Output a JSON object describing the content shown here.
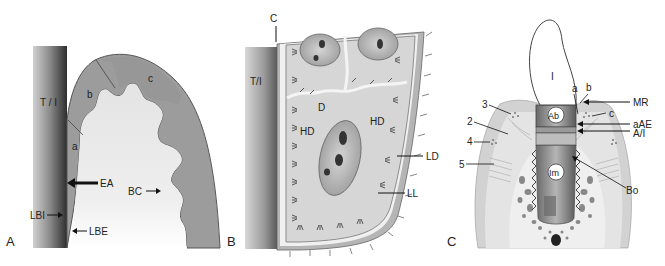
{
  "figure": {
    "panels": [
      {
        "id": "A",
        "label": "A",
        "labels": {
          "ti": "T / I",
          "a": "a",
          "b": "b",
          "c": "c",
          "ea": "EA",
          "bc": "BC",
          "lbi": "LBI",
          "lbe": "LBE"
        }
      },
      {
        "id": "B",
        "label": "B",
        "labels": {
          "c": "C",
          "ti": "T/I",
          "d": "D",
          "hd1": "HD",
          "hd2": "HD",
          "ld": "LD",
          "ll": "LL"
        }
      },
      {
        "id": "C",
        "label": "C",
        "labels": {
          "i": "I",
          "ab": "Ab",
          "im": "Im",
          "a": "a",
          "b": "b",
          "c": "c",
          "mr": "MR",
          "aae": "aAE",
          "ai": "A/I",
          "bo": "Bo",
          "n2": "2",
          "n3": "3",
          "n4": "4",
          "n5": "5"
        }
      }
    ],
    "colors": {
      "tissue_dark": "#9a9a9a",
      "tissue_light": "#c9c9c9",
      "tissue_pale": "#e6e6e6",
      "implant_dark": "#3a3a3a",
      "implant_mid": "#8a8a8a",
      "outline": "#555555",
      "background": "#ffffff"
    }
  }
}
